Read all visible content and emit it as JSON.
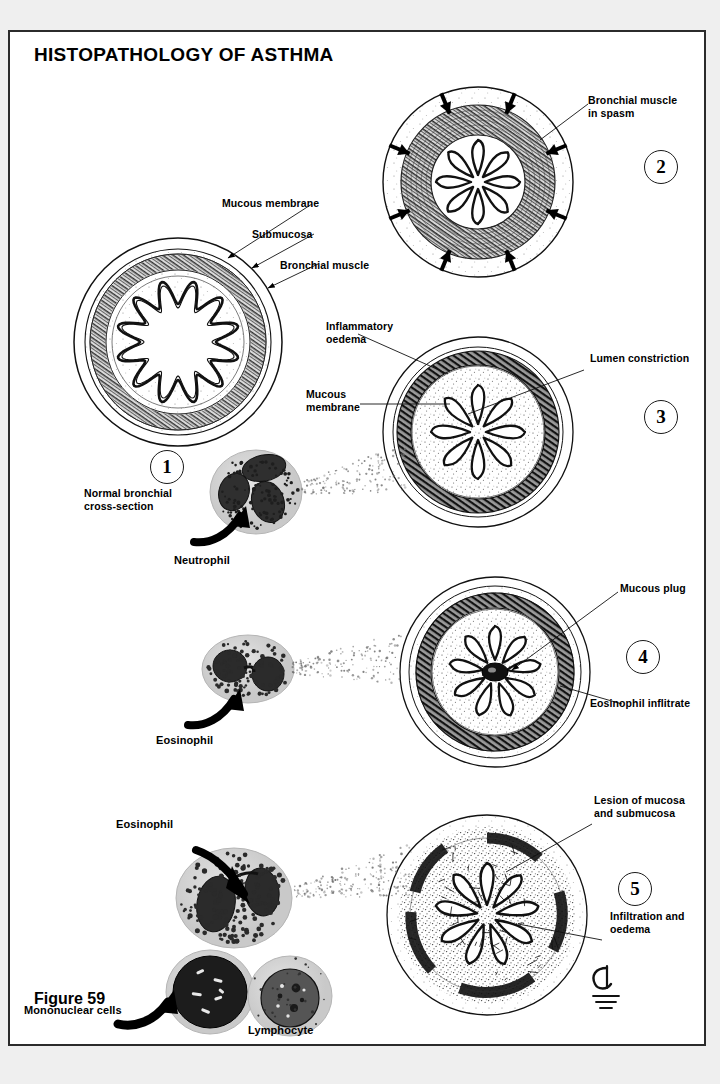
{
  "figure": {
    "title": "HISTOPATHOLOGY OF ASTHMA",
    "caption": "Figure 59",
    "border_color": "#2b2b2b",
    "background": "#ffffff",
    "page_background": "#efefef"
  },
  "panels": [
    {
      "number": "1",
      "caption": "Normal bronchial\ncross-section",
      "labels": [
        {
          "text": "Mucous membrane",
          "target": "mucosa"
        },
        {
          "text": "Submucosa",
          "target": "submucosa"
        },
        {
          "text": "Bronchial muscle",
          "target": "muscle"
        }
      ],
      "state": "normal",
      "lumen_folds": 12,
      "lumen_open": true
    },
    {
      "number": "2",
      "caption": "",
      "labels": [
        {
          "text": "Bronchial muscle\nin spasm",
          "target": "muscle"
        }
      ],
      "state": "bronchospasm",
      "lumen_folds": 8,
      "lumen_open": false,
      "arrows": 8,
      "arrow_direction": "inward"
    },
    {
      "number": "3",
      "caption": "",
      "labels": [
        {
          "text": "Inflammatory\noedema",
          "target": "oedema"
        },
        {
          "text": "Mucous\nmembrane",
          "target": "mucosa"
        },
        {
          "text": "Lumen constriction",
          "target": "lumen"
        }
      ],
      "state": "inflammatory-oedema",
      "lumen_folds": 8,
      "lumen_open": false
    },
    {
      "number": "4",
      "caption": "",
      "labels": [
        {
          "text": "Mucous plug",
          "target": "plug"
        },
        {
          "text": "Eosinophil inflitrate",
          "target": "infiltrate"
        }
      ],
      "state": "mucous-plugging",
      "lumen_folds": 9,
      "lumen_open": false
    },
    {
      "number": "5",
      "caption": "",
      "labels": [
        {
          "text": "Lesion of mucosa\nand submucosa",
          "target": "lesion"
        },
        {
          "text": "Infiltration and\noedema",
          "target": "infiltration"
        }
      ],
      "state": "mucosal-lesion",
      "lumen_folds": 9,
      "lumen_open": false
    }
  ],
  "cells": [
    {
      "name": "Neutrophil",
      "lobes": 3,
      "granules": "fine-dark"
    },
    {
      "name": "Eosinophil",
      "lobes": 2,
      "granules": "coarse-dark"
    },
    {
      "name": "Eosinophil",
      "lobes": 2,
      "granules": "coarse-dark"
    },
    {
      "name": "Mononuclear cells",
      "lobes": 1,
      "granules": "dense-nucleus"
    },
    {
      "name": "Lymphocyte",
      "lobes": 1,
      "granules": "round-nucleus"
    }
  ],
  "signature": {
    "present": true,
    "description": "artist monogram"
  }
}
